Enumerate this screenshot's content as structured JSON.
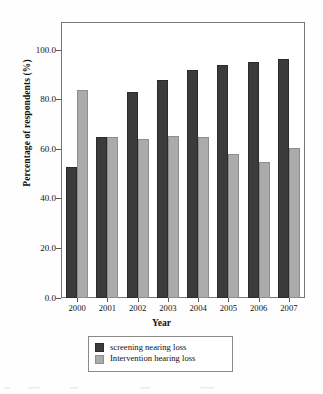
{
  "chart_data": {
    "type": "bar",
    "title": "",
    "xlabel": "Year",
    "ylabel": "Percentage of respondents (%)",
    "categories": [
      "2000",
      "2001",
      "2002",
      "2003",
      "2004",
      "2005",
      "2006",
      "2007"
    ],
    "series": [
      {
        "name": "screening nearing loss",
        "color": "#3b3b3b",
        "values": [
          53.0,
          65.0,
          83.0,
          88.0,
          92.0,
          94.0,
          95.0,
          96.5
        ]
      },
      {
        "name": "Intervention hearing loss",
        "color": "#ababab",
        "values": [
          84.0,
          65.0,
          64.0,
          65.5,
          65.0,
          58.0,
          55.0,
          60.5
        ]
      }
    ],
    "ylim": [
      0.0,
      110.0
    ],
    "yticks": [
      "0.0",
      "20.0",
      "40.0",
      "60.0",
      "80.0",
      "100.0"
    ],
    "ytick_values": [
      0.0,
      20.0,
      40.0,
      60.0,
      80.0,
      100.0
    ],
    "grid": false,
    "legend_position": "below-axes"
  },
  "legend": {
    "entries": [
      {
        "label": "screening nearing loss",
        "swatch": "dark-swatch"
      },
      {
        "label": "Intervention hearing loss",
        "swatch": "gray-swatch"
      }
    ]
  }
}
